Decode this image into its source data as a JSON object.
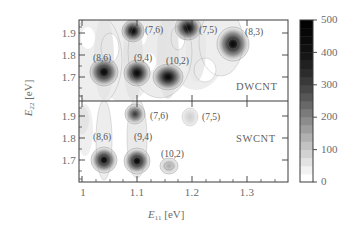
{
  "figure": {
    "type": "contour-map",
    "axes": {
      "x": {
        "label": "E",
        "sub": "11",
        "unit": "[eV]",
        "ticks": [
          "1",
          "1.1",
          "1.2",
          "1.3"
        ],
        "tick_values": [
          1.0,
          1.1,
          1.2,
          1.3
        ],
        "range": [
          0.975,
          1.355
        ],
        "minor_tick_step": 0.025
      },
      "y": {
        "label": "E",
        "sub": "22",
        "unit": "[eV]",
        "ticks": [
          "1.7",
          "1.8",
          "1.9"
        ],
        "tick_values": [
          1.7,
          1.8,
          1.9
        ],
        "range": [
          1.655,
          1.955
        ],
        "minor_tick_step": 0.025
      }
    },
    "panels": [
      {
        "tag": "DWCNT",
        "id": "dwcnt"
      },
      {
        "tag": "SWCNT",
        "id": "swcnt"
      }
    ],
    "colorbar": {
      "ticks": [
        "0",
        "100",
        "200",
        "300",
        "400",
        "500"
      ],
      "tick_values": [
        0,
        100,
        200,
        300,
        400,
        500
      ],
      "range": [
        0,
        500
      ],
      "orientation": "vertical",
      "low_color": "#ffffff",
      "high_color": "#111111",
      "bands": [
        "#ffffff",
        "#f2f2f2",
        "#e2e2e2",
        "#d2d2d2",
        "#c2c2c2",
        "#b0b0b0",
        "#9e9e9e",
        "#8c8c8c",
        "#7a7a7a",
        "#686868",
        "#575757",
        "#474747",
        "#393939",
        "#2c2c2c",
        "#202020",
        "#161616",
        "#101010",
        "#0b0b0b",
        "#070707",
        "#030303"
      ]
    }
  },
  "chart_data": {
    "type": "heatmap",
    "title": "",
    "xlabel": "E11 [eV]",
    "ylabel": "E22 [eV]",
    "xlim": [
      0.975,
      1.355
    ],
    "ylim": [
      1.655,
      1.955
    ],
    "zlim": [
      0,
      500
    ],
    "colorbar_label": "",
    "grid": false,
    "legend": "none",
    "panels": [
      {
        "name": "DWCNT",
        "annotations": [
          {
            "label": "(8,6)",
            "x": 1.043,
            "y": 1.795
          },
          {
            "label": "(9,4)",
            "x": 1.118,
            "y": 1.793
          },
          {
            "label": "(7,6)",
            "x": 1.137,
            "y": 1.905
          },
          {
            "label": "(10,2)",
            "x": 1.186,
            "y": 1.758
          },
          {
            "label": "(7,5)",
            "x": 1.231,
            "y": 1.902
          },
          {
            "label": "(8,3)",
            "x": 1.312,
            "y": 1.898
          }
        ],
        "peaks": [
          {
            "chirality": "(8,6)",
            "x": 1.052,
            "y": 1.712,
            "intensity": 420
          },
          {
            "chirality": "(9,4)",
            "x": 1.115,
            "y": 1.707,
            "intensity": 400
          },
          {
            "chirality": "(10,2)",
            "x": 1.17,
            "y": 1.698,
            "intensity": 500
          },
          {
            "chirality": "(7,6)",
            "x": 1.108,
            "y": 1.9,
            "intensity": 380
          },
          {
            "chirality": "(7,5)",
            "x": 1.206,
            "y": 1.912,
            "intensity": 460
          },
          {
            "chirality": "(8,3)",
            "x": 1.293,
            "y": 1.855,
            "intensity": 450
          }
        ]
      },
      {
        "name": "SWCNT",
        "annotations": [
          {
            "label": "(8,6)",
            "x": 1.042,
            "y": 1.8
          },
          {
            "label": "(9,4)",
            "x": 1.118,
            "y": 1.797
          },
          {
            "label": "(7,6)",
            "x": 1.152,
            "y": 1.903
          },
          {
            "label": "(7,5)",
            "x": 1.233,
            "y": 1.902
          },
          {
            "label": "(10,2)",
            "x": 1.183,
            "y": 1.737
          }
        ],
        "peaks": [
          {
            "chirality": "(8,6)",
            "x": 1.053,
            "y": 1.712,
            "intensity": 430
          },
          {
            "chirality": "(9,4)",
            "x": 1.116,
            "y": 1.709,
            "intensity": 420
          },
          {
            "chirality": "(7,6)",
            "x": 1.113,
            "y": 1.905,
            "intensity": 330
          },
          {
            "chirality": "(10,2)",
            "x": 1.172,
            "y": 1.697,
            "intensity": 230
          },
          {
            "chirality": "(7,5)",
            "x": 1.208,
            "y": 1.905,
            "intensity": 90
          }
        ]
      }
    ]
  }
}
